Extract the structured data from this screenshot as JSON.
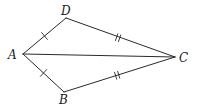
{
  "diagram": {
    "type": "kite",
    "vertices": {
      "A": {
        "label": "A",
        "x": 23,
        "y": 54,
        "label_x": 8,
        "label_y": 59
      },
      "D": {
        "label": "D",
        "x": 66,
        "y": 18,
        "label_x": 61,
        "label_y": 15
      },
      "B": {
        "label": "B",
        "x": 64,
        "y": 92,
        "label_x": 59,
        "label_y": 104
      },
      "C": {
        "label": "C",
        "x": 175,
        "y": 57,
        "label_x": 179,
        "label_y": 62
      }
    },
    "edges": [
      {
        "from": "A",
        "to": "D",
        "ticks": 1
      },
      {
        "from": "D",
        "to": "C",
        "ticks": 2
      },
      {
        "from": "C",
        "to": "B",
        "ticks": 2
      },
      {
        "from": "B",
        "to": "A",
        "ticks": 1
      },
      {
        "from": "A",
        "to": "C",
        "ticks": 0,
        "role": "diagonal"
      }
    ],
    "congruence_marks": {
      "AD_equals_AB": "single tick",
      "DC_equals_BC": "double tick"
    },
    "stroke_color": "#2a2a2a",
    "label_color": "#1a1a1a"
  }
}
